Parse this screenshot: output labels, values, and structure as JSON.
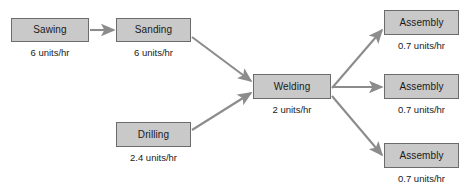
{
  "diagram": {
    "type": "process-flow",
    "title": "",
    "units_label": "units/hr",
    "style": {
      "box_fill": "#c9c9c9",
      "box_border": "#6b6b6b",
      "arrow_color": "#8c8c8c",
      "text_color": "#1a1a1a",
      "background": "#ffffff"
    },
    "nodes": [
      {
        "id": "sawing",
        "label": "Sawing",
        "rate": "6 units/hr",
        "rate_value": 6,
        "x": 11,
        "y": 18,
        "w": 78,
        "h": 24
      },
      {
        "id": "sanding",
        "label": "Sanding",
        "rate": "6 units/hr",
        "rate_value": 6,
        "x": 116,
        "y": 18,
        "w": 75,
        "h": 24
      },
      {
        "id": "drilling",
        "label": "Drilling",
        "rate": "2.4 units/hr",
        "rate_value": 2.4,
        "x": 116,
        "y": 122,
        "w": 75,
        "h": 25
      },
      {
        "id": "welding",
        "label": "Welding",
        "rate": "2 units/hr",
        "rate_value": 2,
        "x": 253,
        "y": 74,
        "w": 78,
        "h": 25
      },
      {
        "id": "assembly-1",
        "label": "Assembly",
        "rate": "0.7 units/hr",
        "rate_value": 0.7,
        "x": 384,
        "y": 10,
        "w": 75,
        "h": 25
      },
      {
        "id": "assembly-2",
        "label": "Assembly",
        "rate": "0.7 units/hr",
        "rate_value": 0.7,
        "x": 384,
        "y": 74,
        "w": 75,
        "h": 25
      },
      {
        "id": "assembly-3",
        "label": "Assembly",
        "rate": "0.7 units/hr",
        "rate_value": 0.7,
        "x": 384,
        "y": 143,
        "w": 75,
        "h": 25
      }
    ],
    "edges": [
      {
        "id": "sawing-to-sanding",
        "from": "sawing",
        "to": "sanding",
        "x1": 90,
        "y1": 30,
        "x2": 114,
        "y2": 30
      },
      {
        "id": "sanding-to-welding",
        "from": "sanding",
        "to": "welding",
        "x1": 192,
        "y1": 37,
        "x2": 251,
        "y2": 81
      },
      {
        "id": "drilling-to-welding",
        "from": "drilling",
        "to": "welding",
        "x1": 192,
        "y1": 130,
        "x2": 251,
        "y2": 93
      },
      {
        "id": "welding-to-assembly-1",
        "from": "welding",
        "to": "assembly-1",
        "x1": 332,
        "y1": 88,
        "x2": 382,
        "y2": 30
      },
      {
        "id": "welding-to-assembly-2",
        "from": "welding",
        "to": "assembly-2",
        "x1": 332,
        "y1": 87,
        "x2": 382,
        "y2": 87
      },
      {
        "id": "welding-to-assembly-3",
        "from": "welding",
        "to": "assembly-3",
        "x1": 332,
        "y1": 96,
        "x2": 382,
        "y2": 155
      }
    ]
  }
}
